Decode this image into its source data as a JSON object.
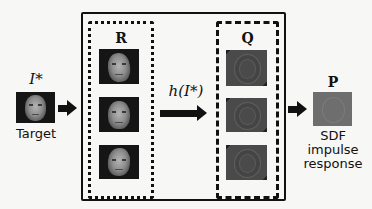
{
  "target": {
    "symbol": "I*",
    "caption": "Target"
  },
  "set_r": {
    "label": "R",
    "item_count": 3
  },
  "operation": {
    "label": "h(I*)"
  },
  "set_q": {
    "label": "Q",
    "item_count": 3
  },
  "output": {
    "label": "P",
    "caption_lines": [
      "SDF",
      "impulse",
      "response"
    ]
  },
  "colors": {
    "background": "#f7f7f5",
    "stroke": "#111111",
    "face_bg": "#151515",
    "filter_gray": "#4a4a4a",
    "impulse_gray": "#6e6e6e"
  }
}
